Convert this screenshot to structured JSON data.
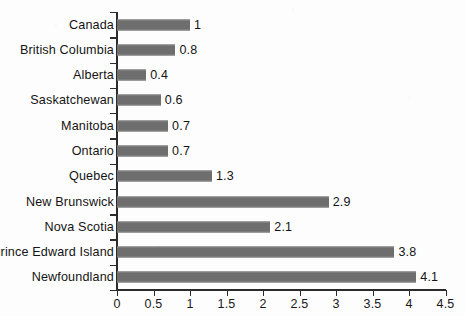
{
  "chart_data": {
    "type": "bar",
    "orientation": "horizontal",
    "title": "",
    "subtitle": "",
    "xlabel": "",
    "ylabel": "",
    "xlim": [
      0,
      4.5
    ],
    "grid": false,
    "legend": null,
    "bar_color": "#6e6e6e",
    "axis_color": "#2b2b2b",
    "text_color": "#141414",
    "categories": [
      "Canada",
      "British Columbia",
      "Alberta",
      "Saskatchewan",
      "Manitoba",
      "Ontario",
      "Quebec",
      "New Brunswick",
      "Nova Scotia",
      "Prince Edward Island",
      "Newfoundland"
    ],
    "values": [
      1,
      0.8,
      0.4,
      0.6,
      0.7,
      0.7,
      1.3,
      2.9,
      2.1,
      3.8,
      4.1
    ],
    "value_labels": [
      "1",
      "0.8",
      "0.4",
      "0.6",
      "0.7",
      "0.7",
      "1.3",
      "2.9",
      "2.1",
      "3.8",
      "4.1"
    ],
    "xticks": [
      0,
      0.5,
      1,
      1.5,
      2,
      2.5,
      3,
      3.5,
      4,
      4.5
    ],
    "xtick_labels": [
      "0",
      "0.5",
      "1",
      "1.5",
      "2",
      "2.5",
      "3",
      "3.5",
      "4",
      "4.5"
    ]
  }
}
